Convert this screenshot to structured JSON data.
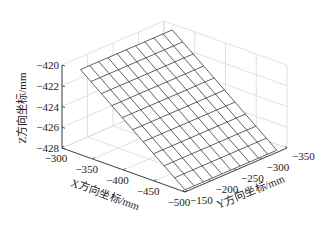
{
  "chart_data": {
    "type": "surface3d",
    "title": "",
    "xlabel": "X方向坐标/mm",
    "ylabel": "Y方向坐标/mm",
    "zlabel": "Z方向坐标/mm",
    "xlim": [
      -500,
      -300
    ],
    "ylim": [
      -350,
      -150
    ],
    "zlim": [
      -428,
      -420
    ],
    "x_ticks": [
      -300,
      -350,
      -400,
      -450,
      -500
    ],
    "y_ticks": [
      -150,
      -200,
      -250,
      -300,
      -350
    ],
    "z_ticks": [
      -428,
      -426,
      -424,
      -422,
      -420
    ],
    "grid": true,
    "mesh": {
      "x_range": [
        -330,
        -500
      ],
      "y_range": [
        -150,
        -330
      ],
      "divisions": 10,
      "plane": {
        "z0": -419.8,
        "x0": -330,
        "dz_dx": 0.047,
        "dz_dy": 0.0
      },
      "description": "Flat inclined plane; Z ranges from about -419.8 at X=-330 to about -427.8 at X=-500, nearly independent of Y"
    },
    "colors": {
      "mesh": "#3a3a3a",
      "grid": "#d9d9d9",
      "axis": "#333333",
      "background": "#ffffff"
    }
  }
}
